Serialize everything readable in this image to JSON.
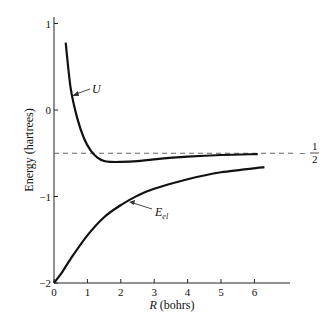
{
  "chart_data": {
    "type": "line",
    "title": "",
    "xlabel": "R (bohrs)",
    "xlabel_var": "R",
    "xlabel_unit": "(bohrs)",
    "ylabel": "Energy (hartrees)",
    "xlim": [
      0,
      7
    ],
    "ylim": [
      -2,
      1
    ],
    "x_ticks": [
      0,
      1,
      2,
      3,
      4,
      5,
      6
    ],
    "x_tick_labels": [
      "0",
      "1",
      "2",
      "3",
      "4",
      "5",
      "6"
    ],
    "y_ticks": [
      1,
      0,
      -1,
      -2
    ],
    "y_tick_labels": [
      "1",
      "0",
      "−1",
      "−2"
    ],
    "grid": false,
    "legend": "none (curves labeled with arrows)",
    "reference_line": {
      "y": -0.5,
      "style": "dashed",
      "label": "− 1/2"
    },
    "series": [
      {
        "name": "U",
        "x": [
          0.35,
          0.5,
          0.7,
          0.9,
          1.1,
          1.3,
          1.5,
          1.7,
          2.0,
          2.5,
          3.0,
          4.0,
          5.0,
          6.1
        ],
        "y": [
          0.78,
          0.25,
          -0.1,
          -0.33,
          -0.47,
          -0.55,
          -0.59,
          -0.6,
          -0.6,
          -0.59,
          -0.57,
          -0.54,
          -0.52,
          -0.51
        ]
      },
      {
        "name": "E_el",
        "x": [
          0.0,
          0.25,
          0.5,
          1.0,
          1.5,
          2.0,
          2.5,
          3.0,
          4.0,
          5.0,
          6.3
        ],
        "y": [
          -2.0,
          -1.87,
          -1.72,
          -1.45,
          -1.24,
          -1.1,
          -0.99,
          -0.91,
          -0.8,
          -0.72,
          -0.66
        ]
      }
    ],
    "annotations": [
      {
        "text": "U",
        "points_to": "U curve near R≈0.5"
      },
      {
        "text": "E_el",
        "points_to": "E_el curve near R≈2.2"
      }
    ]
  },
  "labels": {
    "y_axis_title": "Energy (hartrees)",
    "x_axis_var": "R",
    "x_axis_unit": " (bohrs)",
    "u_label": "U",
    "eel_main": "E",
    "eel_sub": "el",
    "half_minus": "−",
    "half_num": "1",
    "half_den": "2"
  }
}
